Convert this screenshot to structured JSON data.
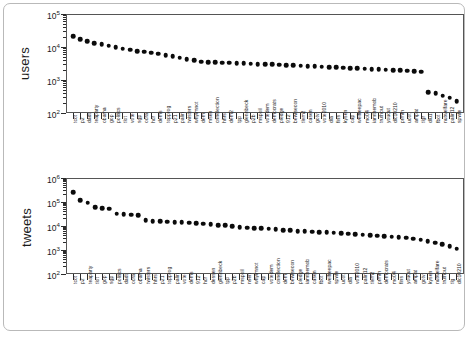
{
  "figure": {
    "background": "#ffffff",
    "border_color": "#b9b9b9",
    "marker_color": "#0b0b0b",
    "axis_color": "#2b2b2b"
  },
  "chart_data": [
    {
      "type": "scatter",
      "title": "",
      "xlabel": "",
      "ylabel": "users",
      "yscale": "log",
      "ylim": [
        100,
        100000
      ],
      "ytick_labels": [
        "10^2",
        "10^3",
        "10^4",
        "10^5"
      ],
      "ytick_values": [
        100,
        1000,
        10000,
        100000
      ],
      "grid": false,
      "legend": "none",
      "categories": [
        "tcot",
        "p2",
        "dadt",
        "teaparty",
        "obama",
        "gop",
        "politics",
        "tlot",
        "vote",
        "sgp",
        "ocra",
        "hcr",
        "dems",
        "topprog",
        "p21",
        "palin",
        "twisters",
        "whyimnot",
        "dem",
        "msen",
        "cnnelection",
        "hhrs",
        "dem2",
        "tpp",
        "glennbeck",
        "p2b",
        "mspoil",
        "votedem",
        "democrats",
        "pledge",
        "912",
        "bewisecon",
        "tlem2",
        "casen",
        "gotv",
        "vote2010",
        "dla",
        "fins",
        "kysen",
        "cap",
        "welfreepac",
        "mo04",
        "iamthemob",
        "truthout",
        "youcut",
        "dlc10210",
        "prmm",
        "ucot",
        "ampat",
        "tlgr",
        "dlu1",
        "fbot",
        "nutwelfare",
        "palin12",
        "spwfe"
      ],
      "values": [
        21000,
        17500,
        15000,
        13000,
        12000,
        11000,
        10000,
        9000,
        8200,
        7600,
        7200,
        6800,
        6200,
        5600,
        5200,
        4700,
        4200,
        3900,
        3600,
        3500,
        3400,
        3350,
        3300,
        3250,
        3200,
        3100,
        3050,
        3000,
        2950,
        2900,
        2850,
        2800,
        2700,
        2650,
        2600,
        2500,
        2450,
        2400,
        2350,
        2300,
        2250,
        2200,
        2150,
        2100,
        2050,
        2000,
        1950,
        1900,
        1850,
        1800,
        430,
        400,
        330,
        290,
        230
      ]
    },
    {
      "type": "scatter",
      "title": "",
      "xlabel": "",
      "ylabel": "tweets",
      "yscale": "log",
      "ylim": [
        100,
        1000000
      ],
      "ytick_labels": [
        "10^2",
        "10^3",
        "10^4",
        "10^5",
        "10^6"
      ],
      "ytick_values": [
        100,
        1000,
        10000,
        100000,
        1000000
      ],
      "grid": false,
      "legend": "none",
      "categories": [
        "tcot",
        "p2",
        "teaparty",
        "tlot",
        "gop",
        "sgp",
        "politics",
        "dadt",
        "ocra",
        "obama",
        "twisters",
        "hhrs",
        "p21",
        "topprog",
        "palin",
        "vote",
        "dems",
        "912",
        "hcr",
        "dessen",
        "glennbeck",
        "tpp",
        "p2b",
        "mspoil",
        "nsen",
        "whyimnot",
        "cap",
        "votedem",
        "cnnelection",
        "dem",
        "bewisecon",
        "pledge",
        "iamthemob",
        "casen",
        "fbot",
        "welfreepac",
        "spwfe",
        "ucot",
        "dla",
        "vote2010",
        "palin12",
        "tlem2",
        "prmm",
        "democrats",
        "mo04",
        "fins",
        "youcut",
        "ampat",
        "gotv",
        "kysen",
        "nutwelfare",
        "truthout",
        "tlg",
        "dlc10210"
      ],
      "values": [
        250000,
        120000,
        95000,
        60000,
        55000,
        52000,
        33000,
        31000,
        30000,
        28000,
        17000,
        16000,
        15500,
        15000,
        14500,
        14000,
        13500,
        13000,
        12500,
        12000,
        11000,
        10500,
        10000,
        9000,
        8500,
        8200,
        8000,
        7600,
        7200,
        6800,
        6500,
        6200,
        6000,
        5800,
        5600,
        5400,
        5200,
        5000,
        4800,
        4600,
        4400,
        4200,
        4000,
        3800,
        3600,
        3400,
        3200,
        3000,
        2700,
        2300,
        2000,
        1700,
        1400,
        1150
      ]
    }
  ]
}
